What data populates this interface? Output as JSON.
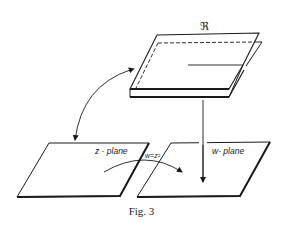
{
  "figure": {
    "caption": "Fig. 3",
    "riemann_surface_label": "ℜ",
    "z_plane_label": "z - plane",
    "w_plane_label": "w- plane",
    "mapping_label": "w=z²",
    "colors": {
      "line": "#1a1a1a",
      "background": "#ffffff"
    }
  }
}
